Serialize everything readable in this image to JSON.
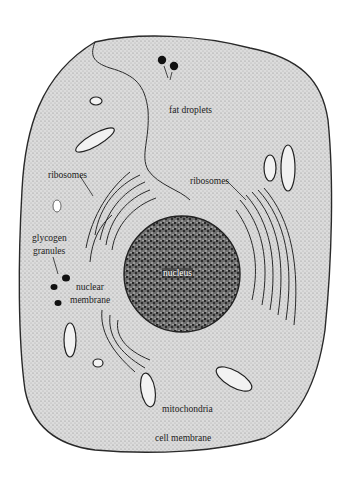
{
  "figure": {
    "labels": {
      "fat_droplets": "fat droplets",
      "ribosomes_left": "ribosomes",
      "ribosomes_right": "ribosomes",
      "glycogen_line1": "glycogen",
      "glycogen_line2": "granules",
      "nuclear_line1": "nuclear",
      "nuclear_line2": "membrane",
      "nucleus": "nucleus",
      "mitochondria": "mitochondria",
      "cell_membrane": "cell membrane"
    },
    "colors": {
      "cytoplasm": "#d9d9d9",
      "outline": "#2a2a2a",
      "nucleus": "#5a5a5a",
      "background": "#ffffff"
    }
  }
}
